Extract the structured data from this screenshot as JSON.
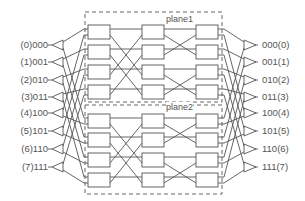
{
  "diagram": {
    "type": "two-plane multistage switching network",
    "planes": [
      {
        "label": "plane1"
      },
      {
        "label": "plane2"
      }
    ],
    "inputs": [
      "(0)000",
      "(1)001",
      "(2)010",
      "(3)011",
      "(4)100",
      "(5)101",
      "(6)110",
      "(7)111"
    ],
    "outputs": [
      "000(0)",
      "001(1)",
      "010(2)",
      "011(3)",
      "100(4)",
      "101(5)",
      "110(6)",
      "111(7)"
    ],
    "stages_per_plane": 3,
    "switches_per_stage": 4,
    "colors": {
      "line": "#555555",
      "box_fill": "#ffffff",
      "background": "#ffffff"
    }
  }
}
